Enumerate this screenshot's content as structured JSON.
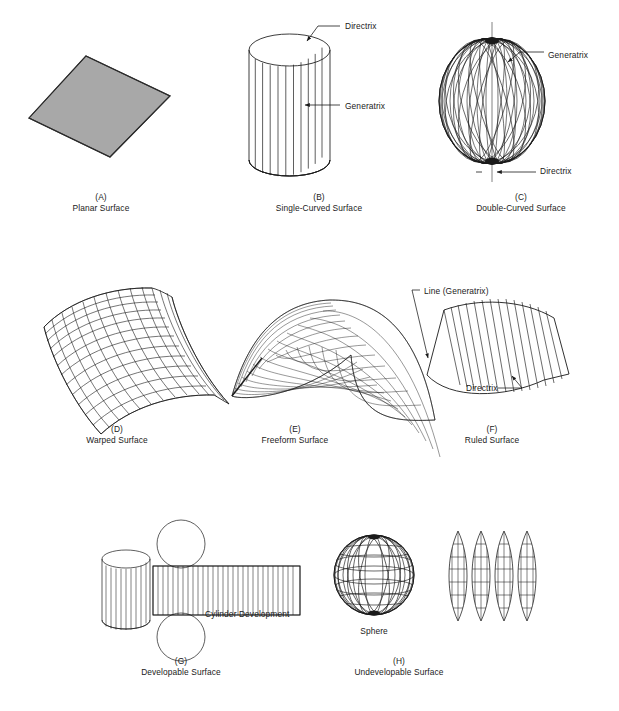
{
  "figure": {
    "background_color": "#ffffff",
    "line_color": "#1a1a1a",
    "fill_gray": "#a8a8a8"
  },
  "panels": [
    {
      "key": "(A)",
      "label": "Planar Surface",
      "caption_x": 101,
      "caption_y": 192,
      "shape": "shaded-parallelogram"
    },
    {
      "key": "(B)",
      "label": "Single-Curved Surface",
      "caption_x": 319,
      "caption_y": 192,
      "shape": "cylinder-with-elements"
    },
    {
      "key": "(C)",
      "label": "Double-Curved Surface",
      "caption_x": 521,
      "caption_y": 192,
      "shape": "sphere-of-revolution"
    },
    {
      "key": "(D)",
      "label": "Warped Surface",
      "caption_x": 117,
      "caption_y": 424,
      "shape": "warped-mesh"
    },
    {
      "key": "(E)",
      "label": "Freeform Surface",
      "caption_x": 295,
      "caption_y": 424,
      "shape": "freeform-mesh"
    },
    {
      "key": "(F)",
      "label": "Ruled Surface",
      "caption_x": 492,
      "caption_y": 424,
      "shape": "ruled-mesh"
    },
    {
      "key": "(G)",
      "label": "Developable Surface",
      "caption_x": 181,
      "caption_y": 656,
      "shape": "cylinder-and-development"
    },
    {
      "key": "(H)",
      "label": "Undevelopable Surface",
      "caption_x": 399,
      "caption_y": 656,
      "shape": "sphere-and-gores"
    }
  ],
  "annotations": [
    {
      "id": "b-directrix",
      "text": "Directrix",
      "x": 345,
      "y": 27
    },
    {
      "id": "b-generatrix",
      "text": "Generatrix",
      "x": 345,
      "y": 107
    },
    {
      "id": "c-generatrix",
      "text": "Generatrix",
      "x": 548,
      "y": 56
    },
    {
      "id": "c-directrix",
      "text": "Directrix",
      "x": 540,
      "y": 172
    },
    {
      "id": "f-generatrix",
      "text": "Line (Generatrix)",
      "x": 424,
      "y": 292
    },
    {
      "id": "f-directrix",
      "text": "Directrix",
      "x": 466,
      "y": 389
    },
    {
      "id": "g-development",
      "text": "Cylinder Development",
      "x": 205,
      "y": 615
    },
    {
      "id": "h-sphere",
      "text": "Sphere",
      "x": 374,
      "y": 632
    }
  ]
}
